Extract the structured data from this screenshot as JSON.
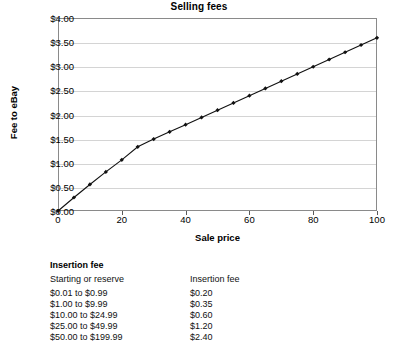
{
  "chart_data": {
    "type": "line",
    "title": "Selling fees",
    "xlabel": "Sale price",
    "ylabel": "Fee to eBay",
    "xlim": [
      0,
      100
    ],
    "ylim": [
      0,
      4.0
    ],
    "grid": true,
    "legend": "none",
    "marker": "diamond",
    "line_color": "#111111",
    "grid_color": "#d4d4d4",
    "xticks": [
      "0",
      "20",
      "40",
      "60",
      "80",
      "100"
    ],
    "xtick_values": [
      0,
      20,
      40,
      60,
      80,
      100
    ],
    "yticks": [
      "$0.00",
      "$0.50",
      "$1.00",
      "$1.50",
      "$2.00",
      "$2.50",
      "$3.00",
      "$3.50",
      "$4.00"
    ],
    "ytick_values": [
      0,
      0.5,
      1.0,
      1.5,
      2.0,
      2.5,
      3.0,
      3.5,
      4.0
    ],
    "x": [
      0,
      5,
      10,
      15,
      20,
      25,
      30,
      35,
      40,
      45,
      50,
      55,
      60,
      65,
      70,
      75,
      80,
      85,
      90,
      95,
      100
    ],
    "values": [
      0.0,
      0.28,
      0.55,
      0.81,
      1.06,
      1.33,
      1.49,
      1.64,
      1.79,
      1.94,
      2.09,
      2.24,
      2.39,
      2.54,
      2.69,
      2.84,
      2.99,
      3.14,
      3.29,
      3.44,
      3.59
    ]
  },
  "fee_table": {
    "title": "Insertion fee",
    "columns": [
      "Starting or reserve",
      "Insertion fee"
    ],
    "rows": [
      {
        "range": "$0.01 to $0.99",
        "fee": "$0.20"
      },
      {
        "range": "$1.00 to $9.99",
        "fee": "$0.35"
      },
      {
        "range": "$10.00 to $24.99",
        "fee": "$0.60"
      },
      {
        "range": "$25.00 to $49.99",
        "fee": "$1.20"
      },
      {
        "range": "$50.00 to $199.99",
        "fee": "$2.40"
      }
    ]
  }
}
